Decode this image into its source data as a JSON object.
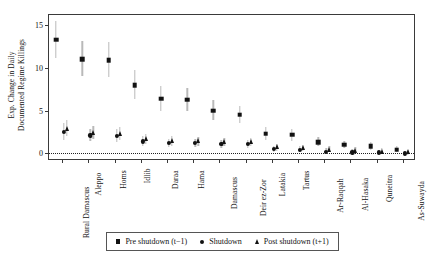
{
  "chart_data": {
    "type": "scatter",
    "title": "",
    "xlabel": "",
    "ylabel_line1": "Exp. Change in Daily",
    "ylabel_line2": "Documented Regime Killings",
    "ylim": [
      -0.9,
      16.2
    ],
    "yticks": [
      0,
      5,
      10,
      15
    ],
    "ytick_labels": [
      "0",
      "5",
      "10",
      "15"
    ],
    "grid": false,
    "zero_reference_line": 0,
    "legend_position": "bottom-center",
    "categories": [
      "Rural Damascus",
      "Aleppo",
      "Homs",
      "Idlib",
      "Daraa",
      "Hama",
      "Damascus",
      "Deir ez-Zor",
      "Latakia",
      "Tartus",
      "Ar-Raqqah",
      "Al-Hasaka",
      "Quneitra",
      "As-Suwayda"
    ],
    "series": [
      {
        "name": "Pre shutdown (t−1)",
        "marker": "square",
        "values": [
          13.3,
          11.0,
          10.9,
          8.0,
          6.4,
          6.3,
          5.0,
          4.5,
          2.3,
          2.2,
          1.3,
          1.0,
          0.8,
          0.4
        ],
        "ci_low": [
          11.2,
          9.0,
          8.9,
          6.4,
          5.0,
          5.0,
          3.9,
          3.5,
          1.6,
          1.5,
          0.8,
          0.6,
          0.4,
          0.1
        ],
        "ci_high": [
          15.5,
          13.1,
          13.0,
          9.7,
          7.9,
          7.7,
          6.2,
          5.6,
          3.1,
          2.9,
          1.9,
          1.5,
          1.3,
          0.8
        ]
      },
      {
        "name": "Shutdown",
        "marker": "circle",
        "values": [
          2.5,
          2.1,
          2.0,
          1.4,
          1.2,
          1.2,
          1.1,
          1.1,
          0.5,
          0.4,
          0.2,
          0.1,
          0.1,
          0.0
        ],
        "ci_low": [
          1.6,
          1.4,
          1.3,
          0.9,
          0.7,
          0.7,
          0.6,
          0.6,
          0.2,
          0.1,
          -0.1,
          -0.2,
          -0.2,
          -0.3
        ],
        "ci_high": [
          3.5,
          2.9,
          2.8,
          2.0,
          1.7,
          1.7,
          1.6,
          1.6,
          0.9,
          0.8,
          0.6,
          0.5,
          0.4,
          0.3
        ]
      },
      {
        "name": "Post shutdown (t+1)",
        "marker": "triangle",
        "values": [
          2.9,
          2.4,
          2.3,
          1.7,
          1.4,
          1.4,
          1.3,
          1.3,
          0.7,
          0.6,
          0.4,
          0.3,
          0.2,
          0.1
        ],
        "ci_low": [
          2.0,
          1.7,
          1.6,
          1.1,
          0.9,
          0.9,
          0.8,
          0.8,
          0.3,
          0.3,
          0.1,
          0.0,
          -0.1,
          -0.2
        ],
        "ci_high": [
          3.9,
          3.2,
          3.1,
          2.3,
          2.0,
          1.9,
          1.8,
          1.8,
          1.1,
          1.0,
          0.8,
          0.7,
          0.6,
          0.4
        ]
      }
    ]
  },
  "legend": {
    "items": [
      {
        "label": "Pre shutdown (t−1)",
        "marker": "square"
      },
      {
        "label": "Shutdown",
        "marker": "circle"
      },
      {
        "label": "Post shutdown (t+1)",
        "marker": "triangle"
      }
    ]
  },
  "colors": {
    "marker": "#121212",
    "confidence_interval": "#b9b9b9",
    "axis": "#3a3a3a",
    "background": "#ffffff"
  }
}
